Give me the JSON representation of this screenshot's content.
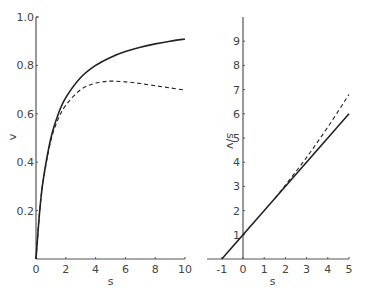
{
  "chart_data": [
    {
      "type": "line",
      "title": "",
      "xlabel": "s",
      "ylabel": "v",
      "xlim": [
        0,
        10
      ],
      "ylim": [
        0,
        1.0
      ],
      "x_ticks": [
        "0",
        "2",
        "4",
        "6",
        "8",
        "10"
      ],
      "y_ticks": [
        "0.2",
        "0.4",
        "0.6",
        "0.8",
        "1.0"
      ],
      "grid": false,
      "legend": null,
      "series": [
        {
          "name": "solid",
          "style": "solid",
          "x": [
            0,
            0.25,
            0.5,
            1,
            1.5,
            2,
            3,
            4,
            5,
            6,
            7,
            8,
            9,
            10
          ],
          "y": [
            0,
            0.2,
            0.333,
            0.5,
            0.6,
            0.667,
            0.75,
            0.8,
            0.833,
            0.857,
            0.875,
            0.889,
            0.9,
            0.909
          ]
        },
        {
          "name": "dashed",
          "style": "dashed",
          "x": [
            0,
            0.25,
            0.5,
            1,
            1.5,
            2,
            3,
            4,
            5,
            6,
            7,
            8,
            9,
            10
          ],
          "y": [
            0,
            0.2,
            0.33,
            0.49,
            0.58,
            0.635,
            0.7,
            0.727,
            0.735,
            0.732,
            0.725,
            0.716,
            0.707,
            0.698
          ]
        }
      ]
    },
    {
      "type": "line",
      "title": "",
      "xlabel": "s",
      "ylabel": "s/v",
      "xlim": [
        -1.5,
        5
      ],
      "ylim": [
        0,
        10
      ],
      "x_ticks": [
        "-1",
        "0",
        "1",
        "2",
        "3",
        "4",
        "5"
      ],
      "y_ticks": [
        "1",
        "2",
        "3",
        "4",
        "5",
        "6",
        "7",
        "8",
        "9"
      ],
      "grid": false,
      "legend": null,
      "series": [
        {
          "name": "solid",
          "style": "solid",
          "x": [
            -1,
            0,
            1,
            2,
            3,
            4,
            5
          ],
          "y": [
            0,
            1,
            2,
            3,
            4,
            5,
            6
          ]
        },
        {
          "name": "dashed",
          "style": "dashed",
          "x": [
            1.5,
            2,
            3,
            4,
            5
          ],
          "y": [
            2.5,
            3.05,
            4.2,
            5.45,
            6.8
          ]
        }
      ]
    }
  ]
}
